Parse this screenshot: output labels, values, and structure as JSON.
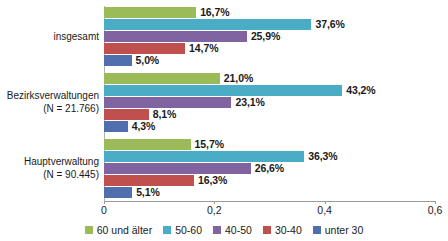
{
  "chart_data": {
    "type": "bar",
    "orientation": "horizontal",
    "title": "",
    "subtitle": "",
    "xlabel": "",
    "ylabel": "",
    "xlim": [
      0,
      0.6
    ],
    "xticks": [
      0,
      0.2,
      0.4,
      0.6
    ],
    "xtick_labels": [
      "0",
      "0,2",
      "0,4",
      "0,6"
    ],
    "grid": false,
    "legend_position": "bottom",
    "categories": [
      {
        "id": "insgesamt",
        "label_line1": "insgesamt",
        "label_line2": ""
      },
      {
        "id": "bezirksverwaltungen",
        "label_line1": "Bezirksverwaltungen",
        "label_line2": "(N = 21.766)"
      },
      {
        "id": "hauptverwaltung",
        "label_line1": "Hauptverwaltung",
        "label_line2": "(N = 90.445)"
      }
    ],
    "series": [
      {
        "name": "60 und älter",
        "color": "#9bbb59",
        "values": [
          0.167,
          0.21,
          0.157
        ],
        "value_labels": [
          "16,7%",
          "21,0%",
          "15,7%"
        ]
      },
      {
        "name": "50-60",
        "color": "#4bacc6",
        "values": [
          0.376,
          0.432,
          0.363
        ],
        "value_labels": [
          "37,6%",
          "43,2%",
          "36,3%"
        ]
      },
      {
        "name": "40-50",
        "color": "#8064a2",
        "values": [
          0.259,
          0.231,
          0.266
        ],
        "value_labels": [
          "25,9%",
          "23,1%",
          "26,6%"
        ]
      },
      {
        "name": "30-40",
        "color": "#c0504d",
        "values": [
          0.147,
          0.081,
          0.163
        ],
        "value_labels": [
          "14,7%",
          "8,1%",
          "16,3%"
        ]
      },
      {
        "name": "unter 30",
        "color": "#4f6fad",
        "values": [
          0.05,
          0.043,
          0.051
        ],
        "value_labels": [
          "5,0%",
          "4,3%",
          "5,1%"
        ]
      }
    ]
  },
  "legend": {
    "items": [
      {
        "label": "60 und älter",
        "color": "#9bbb59"
      },
      {
        "label": "50-60",
        "color": "#4bacc6"
      },
      {
        "label": "40-50",
        "color": "#8064a2"
      },
      {
        "label": "30-40",
        "color": "#c0504d"
      },
      {
        "label": "unter 30",
        "color": "#4f6fad"
      }
    ]
  },
  "axis": {
    "ticks": [
      {
        "label": "0",
        "value": 0
      },
      {
        "label": "0,2",
        "value": 0.2
      },
      {
        "label": "0,4",
        "value": 0.4
      },
      {
        "label": "0,6",
        "value": 0.6
      }
    ]
  }
}
